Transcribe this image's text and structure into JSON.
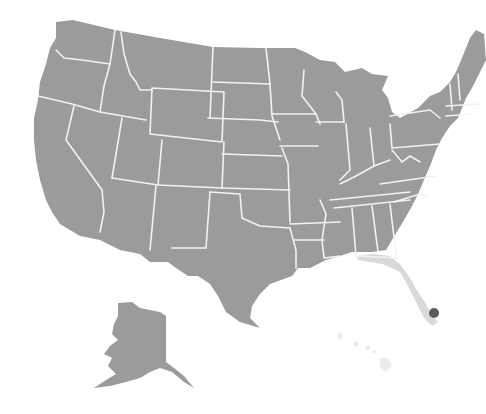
{
  "map": {
    "title": "United States map",
    "base_color": "#9b9b9b",
    "border_color": "#f2f2f2",
    "highlighted_state": {
      "name": "Florida",
      "color": "#d9d9d9"
    },
    "faded_state": {
      "name": "Hawaii",
      "color": "#ececec"
    },
    "marker": {
      "label": "Miami",
      "color": "#5a5a5a",
      "x": 434,
      "y": 313,
      "r": 5
    }
  }
}
